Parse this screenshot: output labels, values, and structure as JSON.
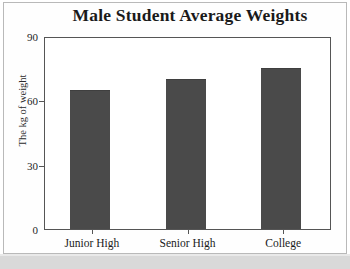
{
  "chart_data": {
    "type": "bar",
    "title": "Male Student Average Weights",
    "xlabel": "",
    "ylabel": "The kg of weight",
    "categories": [
      "Junior High",
      "Senior High",
      "College"
    ],
    "values": [
      65,
      70,
      75
    ],
    "ylim": [
      0,
      90
    ],
    "yticks": [
      0,
      30,
      60,
      90
    ],
    "ytick_labels": [
      "0",
      "30",
      "60",
      "90"
    ],
    "grid": false,
    "legend": false,
    "legend_position": "none",
    "series": [
      {
        "name": "Average weight (kg)",
        "values": [
          65,
          70,
          75
        ],
        "color": "#4a4a4a"
      }
    ]
  },
  "colors": {
    "bar_fill": "#4a4a4a",
    "axis": "#555555",
    "text": "#1a1a1a",
    "page_background": "#ffffff",
    "page_border": "#b9b9b9",
    "scan_band": "#d9d9d9"
  }
}
